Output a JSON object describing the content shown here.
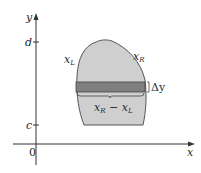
{
  "diagram": {
    "axes": {
      "x_label": "x",
      "y_label": "y",
      "origin_label": "0",
      "y_ticks": [
        {
          "label": "d",
          "y": 42
        },
        {
          "label": "c",
          "y": 125
        }
      ]
    },
    "region": {
      "left_curve_label": "x",
      "left_curve_sub": "L",
      "right_curve_label": "x",
      "right_curve_sub": "R",
      "fill_color": "#cfcfcf",
      "outline_color": "#555555"
    },
    "strip": {
      "fill_color": "#7f7f7f",
      "thickness_label": "Δy",
      "width_label_a": "x",
      "width_label_a_sub": "R",
      "width_label_op": " − ",
      "width_label_b": "x",
      "width_label_b_sub": "L"
    }
  }
}
